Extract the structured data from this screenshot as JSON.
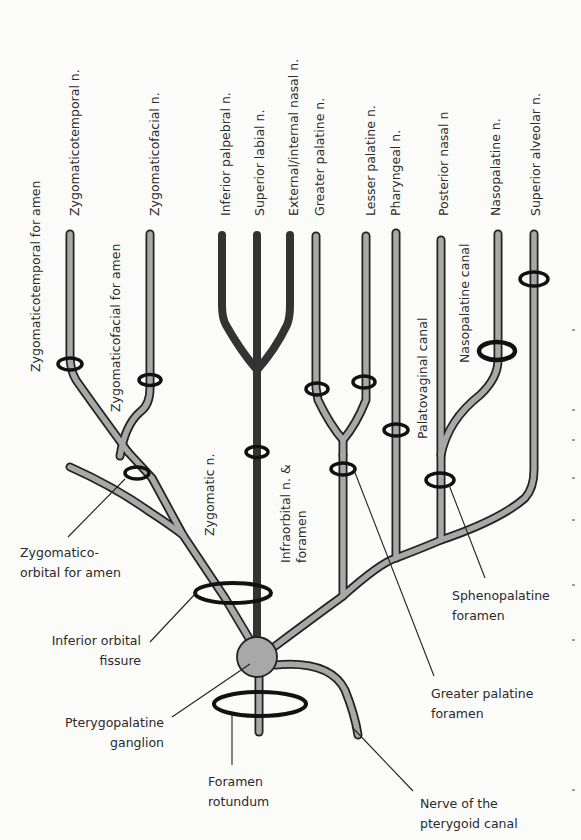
{
  "figure": {
    "colors": {
      "background": "#fbfbf9",
      "nerve_fill_light": "#a8a8a8",
      "nerve_fill_dark": "#3a3a3a",
      "nerve_outline": "#222222",
      "ring": "#111111",
      "text": "#2a2a2a",
      "leader": "#222222"
    },
    "top_branch_labels": {
      "zygomaticotemporal_n": "Zygomaticotemporal n.",
      "zygomaticofacial_n": "Zygomaticofacial n.",
      "inferior_palpebral_n": "Inferior palpebral n.",
      "superior_labial_n": "Superior labial n.",
      "external_internal_nasal_n": "External/internal nasal n.",
      "greater_palatine_n": "Greater palatine n.",
      "lesser_palatine_n": "Lesser palatine n.",
      "pharyngeal_n": "Pharyngeal n.",
      "posterior_nasal_n": "Posterior nasal n",
      "nasopalatine_n": "Nasopalatine n.",
      "superior_alveolar_n": "Superior alveolar n."
    },
    "vertical_labels": {
      "zygomaticotemporal_foramen": "Zygomaticotemporal for amen",
      "zygomaticofacial_foramen": "Zygomaticofacial for amen",
      "zygomatic_n": "Zygomatic n.",
      "infraorbital_line1": "Infraorbital n. &",
      "infraorbital_line2": "foramen",
      "palatovaginal_canal": "Palatovaginal canal",
      "nasopalatine_canal": "Nasopalatine canal"
    },
    "callouts": {
      "zygomatico_orbital_line1": "Zygomatico-",
      "zygomatico_orbital_line2": "orbital for amen",
      "inferior_orbital_line1": "Inferior orbital",
      "inferior_orbital_line2": "fissure",
      "pterygopalatine_line1": "Pterygopalatine",
      "pterygopalatine_line2": "ganglion",
      "foramen_rotundum_line1": "Foramen",
      "foramen_rotundum_line2": "rotundum",
      "sphenopalatine_line1": "Sphenopalatine",
      "sphenopalatine_line2": "foramen",
      "greater_palatine_foramen_line1": "Greater palatine",
      "greater_palatine_foramen_line2": "foramen",
      "pterygoid_canal_line1": "Nerve of the",
      "pterygoid_canal_line2": "pterygoid canal"
    }
  }
}
